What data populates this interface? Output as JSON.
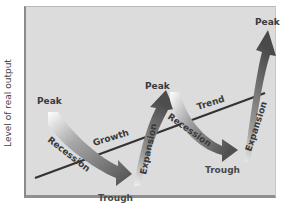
{
  "axis": {
    "ylabel": "Level of real output"
  },
  "labels": {
    "peak1": "Peak",
    "peak2": "Peak",
    "peak3": "Peak",
    "trough1": "Trough",
    "trough2": "Trough",
    "recession1": "Recession",
    "recession2": "Recession",
    "expansion1": "Expansion",
    "expansion2": "Expansion",
    "growth": "Growth",
    "trend": "Trend"
  },
  "colors": {
    "background": "#dcdcdc",
    "frame_border": "#8a8a8a",
    "trend_line": "#333333",
    "arrow_dark": "#4d4d4d",
    "arrow_light": "#ffffff",
    "text": "#3a3a3a"
  }
}
